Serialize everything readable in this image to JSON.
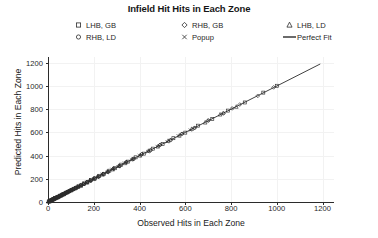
{
  "chart_data": {
    "type": "scatter",
    "title": "Infield Hit Hits in Each Zone",
    "xlabel": "Observed Hits in Each Zone",
    "ylabel": "Predicted Hits in Each Zone",
    "xlim": [
      0,
      1250
    ],
    "ylim": [
      0,
      1250
    ],
    "xticks": [
      0,
      200,
      400,
      600,
      800,
      1000,
      1200
    ],
    "yticks": [
      0,
      200,
      400,
      600,
      800,
      1000,
      1200
    ],
    "grid": true,
    "grid_color": "#f2f2f2",
    "legend_position": "top",
    "marker_color": "#2b2b2b",
    "line_color": "#2b2b2b",
    "legend": [
      {
        "label": "LHB, GB",
        "marker": "square-marker"
      },
      {
        "label": "RHB, GB",
        "marker": "diamond-marker"
      },
      {
        "label": "LHB, LD",
        "marker": "triangle-marker"
      },
      {
        "label": "RHB, LD",
        "marker": "circle-marker"
      },
      {
        "label": "Popup",
        "marker": "x-marker"
      },
      {
        "label": "Perfect Fit",
        "marker": "line-marker"
      }
    ],
    "reference_line": {
      "name": "Perfect Fit",
      "x": [
        0,
        1190
      ],
      "y": [
        0,
        1190
      ]
    },
    "series": [
      {
        "name": "LHB, GB",
        "marker": "square-marker",
        "points": [
          [
            5,
            6
          ],
          [
            9,
            10
          ],
          [
            12,
            11
          ],
          [
            15,
            17
          ],
          [
            18,
            16
          ],
          [
            22,
            24
          ],
          [
            26,
            25
          ],
          [
            31,
            33
          ],
          [
            35,
            34
          ],
          [
            41,
            43
          ],
          [
            46,
            45
          ],
          [
            52,
            54
          ],
          [
            58,
            57
          ],
          [
            64,
            66
          ],
          [
            71,
            70
          ],
          [
            78,
            80
          ],
          [
            86,
            85
          ],
          [
            94,
            96
          ],
          [
            103,
            102
          ],
          [
            112,
            114
          ],
          [
            122,
            120
          ],
          [
            133,
            135
          ],
          [
            145,
            143
          ],
          [
            158,
            160
          ],
          [
            172,
            170
          ],
          [
            188,
            190
          ],
          [
            205,
            203
          ],
          [
            224,
            226
          ],
          [
            245,
            243
          ],
          [
            268,
            270
          ],
          [
            293,
            291
          ],
          [
            320,
            322
          ],
          [
            350,
            348
          ],
          [
            383,
            385
          ],
          [
            419,
            417
          ],
          [
            458,
            460
          ],
          [
            501,
            499
          ],
          [
            548,
            550
          ],
          [
            600,
            598
          ],
          [
            656,
            658
          ],
          [
            718,
            716
          ],
          [
            786,
            788
          ],
          [
            860,
            858
          ],
          [
            941,
            943
          ],
          [
            1000,
            1002
          ]
        ]
      },
      {
        "name": "RHB, GB",
        "marker": "diamond-marker",
        "points": [
          [
            4,
            5
          ],
          [
            8,
            7
          ],
          [
            11,
            13
          ],
          [
            14,
            14
          ],
          [
            19,
            18
          ],
          [
            23,
            25
          ],
          [
            28,
            27
          ],
          [
            33,
            35
          ],
          [
            38,
            37
          ],
          [
            44,
            46
          ],
          [
            50,
            49
          ],
          [
            56,
            58
          ],
          [
            62,
            61
          ],
          [
            69,
            71
          ],
          [
            76,
            75
          ],
          [
            84,
            86
          ],
          [
            92,
            91
          ],
          [
            101,
            103
          ],
          [
            110,
            109
          ],
          [
            121,
            123
          ],
          [
            131,
            130
          ],
          [
            143,
            145
          ],
          [
            156,
            154
          ],
          [
            170,
            172
          ],
          [
            185,
            183
          ],
          [
            202,
            204
          ],
          [
            220,
            218
          ],
          [
            240,
            242
          ],
          [
            262,
            260
          ],
          [
            286,
            288
          ],
          [
            313,
            311
          ],
          [
            342,
            344
          ],
          [
            374,
            372
          ],
          [
            409,
            411
          ],
          [
            447,
            445
          ],
          [
            489,
            491
          ],
          [
            535,
            533
          ],
          [
            585,
            587
          ],
          [
            640,
            638
          ],
          [
            700,
            702
          ],
          [
            766,
            764
          ],
          [
            838,
            840
          ],
          [
            917,
            915
          ],
          [
            986,
            988
          ]
        ]
      },
      {
        "name": "LHB, LD",
        "marker": "triangle-marker",
        "points": [
          [
            3,
            4
          ],
          [
            7,
            6
          ],
          [
            10,
            11
          ],
          [
            13,
            13
          ],
          [
            17,
            18
          ],
          [
            21,
            20
          ],
          [
            25,
            26
          ],
          [
            30,
            29
          ],
          [
            36,
            37
          ],
          [
            42,
            40
          ],
          [
            48,
            49
          ],
          [
            54,
            53
          ],
          [
            61,
            62
          ],
          [
            68,
            67
          ],
          [
            75,
            77
          ],
          [
            83,
            82
          ],
          [
            91,
            93
          ],
          [
            100,
            99
          ],
          [
            109,
            111
          ],
          [
            119,
            118
          ],
          [
            130,
            132
          ],
          [
            142,
            140
          ],
          [
            155,
            157
          ],
          [
            169,
            167
          ],
          [
            184,
            186
          ],
          [
            200,
            198
          ],
          [
            218,
            220
          ],
          [
            238,
            236
          ],
          [
            259,
            261
          ],
          [
            283,
            281
          ],
          [
            309,
            311
          ],
          [
            337,
            335
          ],
          [
            368,
            370
          ],
          [
            402,
            400
          ],
          [
            439,
            441
          ],
          [
            480,
            478
          ],
          [
            525,
            527
          ],
          [
            574,
            572
          ],
          [
            628,
            630
          ],
          [
            687,
            685
          ],
          [
            752,
            754
          ],
          [
            823,
            821
          ]
        ]
      },
      {
        "name": "RHB, LD",
        "marker": "circle-marker",
        "points": [
          [
            6,
            5
          ],
          [
            10,
            11
          ],
          [
            13,
            12
          ],
          [
            16,
            18
          ],
          [
            20,
            19
          ],
          [
            24,
            26
          ],
          [
            29,
            28
          ],
          [
            34,
            36
          ],
          [
            40,
            39
          ],
          [
            45,
            47
          ],
          [
            51,
            50
          ],
          [
            57,
            59
          ],
          [
            63,
            62
          ],
          [
            70,
            72
          ],
          [
            77,
            76
          ],
          [
            85,
            87
          ],
          [
            93,
            92
          ],
          [
            102,
            104
          ],
          [
            111,
            110
          ],
          [
            122,
            124
          ],
          [
            132,
            131
          ],
          [
            144,
            146
          ],
          [
            157,
            155
          ],
          [
            171,
            173
          ],
          [
            186,
            184
          ],
          [
            203,
            205
          ],
          [
            221,
            219
          ],
          [
            241,
            243
          ],
          [
            263,
            261
          ],
          [
            287,
            289
          ],
          [
            314,
            312
          ],
          [
            343,
            345
          ],
          [
            375,
            373
          ],
          [
            410,
            412
          ],
          [
            448,
            446
          ],
          [
            490,
            492
          ],
          [
            536,
            534
          ],
          [
            586,
            588
          ],
          [
            641,
            639
          ],
          [
            701,
            703
          ],
          [
            767,
            765
          ],
          [
            805,
            807
          ]
        ]
      },
      {
        "name": "Popup",
        "marker": "x-marker",
        "points": [
          [
            2,
            3
          ],
          [
            5,
            4
          ],
          [
            8,
            9
          ],
          [
            11,
            10
          ],
          [
            14,
            15
          ],
          [
            18,
            17
          ],
          [
            22,
            23
          ],
          [
            27,
            26
          ],
          [
            32,
            33
          ],
          [
            37,
            36
          ],
          [
            43,
            44
          ],
          [
            49,
            48
          ],
          [
            55,
            56
          ],
          [
            62,
            61
          ],
          [
            69,
            70
          ],
          [
            76,
            75
          ],
          [
            84,
            85
          ],
          [
            92,
            91
          ],
          [
            101,
            102
          ],
          [
            110,
            109
          ],
          [
            120,
            121
          ],
          [
            131,
            129
          ],
          [
            142,
            144
          ],
          [
            154,
            152
          ],
          [
            168,
            169
          ],
          [
            183,
            181
          ],
          [
            199,
            201
          ],
          [
            217,
            215
          ],
          [
            236,
            238
          ],
          [
            257,
            255
          ],
          [
            280,
            282
          ],
          [
            306,
            304
          ],
          [
            334,
            336
          ],
          [
            365,
            363
          ],
          [
            399,
            401
          ],
          [
            436,
            434
          ],
          [
            477,
            479
          ],
          [
            521,
            519
          ],
          [
            569,
            571
          ],
          [
            622,
            620
          ]
        ]
      }
    ]
  }
}
